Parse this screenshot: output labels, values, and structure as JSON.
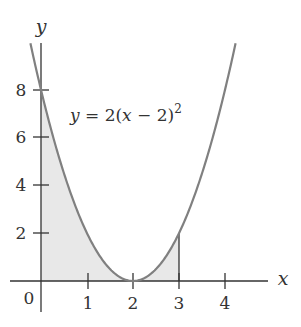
{
  "chart_data": {
    "type": "line",
    "title": "",
    "equation_label": "y = 2(x − 2)²",
    "function": "y = 2(x - 2)^2",
    "xlabel": "x",
    "ylabel": "y",
    "xlim": [
      -0.25,
      5
    ],
    "ylim": [
      -1,
      10
    ],
    "x_ticks": [
      1,
      2,
      3,
      4
    ],
    "x_tick_labels": [
      "1",
      "2",
      "3",
      "4"
    ],
    "y_ticks": [
      2,
      4,
      6,
      8
    ],
    "y_tick_labels": [
      "2",
      "4",
      "6",
      "8"
    ],
    "origin_label": "0",
    "grid": false,
    "legend": null,
    "series": [
      {
        "name": "y = 2(x − 2)²",
        "x": [
          -0.2,
          0,
          0.5,
          1,
          1.5,
          2,
          2.5,
          3,
          3.5,
          4,
          4.2
        ],
        "y": [
          9.68,
          8,
          4.5,
          2,
          0.5,
          0,
          0.5,
          2,
          4.5,
          8,
          9.68
        ],
        "color": "#808080"
      }
    ],
    "shaded_region": {
      "description": "Area under curve from x = 0 to x = 3",
      "x_from": 0,
      "x_to": 3,
      "fill": "#e8e8e8",
      "boundary_line_at_x": 3,
      "boundary_line_top_y": 2
    },
    "colors": {
      "curve": "#808080",
      "axis": "#333333",
      "shade": "#e8e8e8"
    }
  },
  "labels": {
    "equation_lhs": "y",
    "equation_eq": " = 2(",
    "equation_var": "x",
    "equation_rest": " − 2)",
    "equation_exp": "2",
    "axis_x": "x",
    "axis_y": "y",
    "origin": "0",
    "xt1": "1",
    "xt2": "2",
    "xt3": "3",
    "xt4": "4",
    "yt2": "2",
    "yt4": "4",
    "yt6": "6",
    "yt8": "8"
  }
}
